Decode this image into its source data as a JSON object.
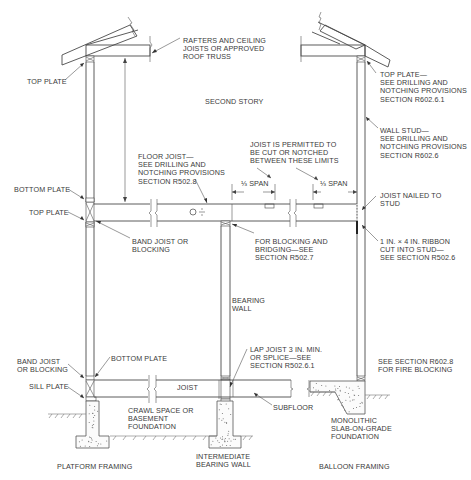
{
  "diagram": {
    "title_left": "PLATFORM FRAMING",
    "title_right": "BALLOON FRAMING",
    "title_center": "INTERMEDIATE\nBEARING WALL",
    "labels": {
      "rafters": "RAFTERS AND CEILING\nJOISTS OR APPROVED\nROOF TRUSS",
      "top_plate_left": "TOP PLATE",
      "second_story": "SECOND STORY",
      "top_plate_right": "TOP PLATE—\nSEE DRILLING AND\nNOTCHING PROVISIONS\nSECTION R602.6.1",
      "wall_stud": "WALL STUD—\nSEE DRILLING AND\nNOTCHING PROVISIONS\nSECTION R602.6",
      "floor_joist": "FLOOR JOIST—\nSEE DRILLING AND\nNOTCHING PROVISIONS\nSECTION R502.8",
      "joist_permitted": "JOIST IS PERMITTED TO\nBE CUT OR NOTCHED\nBETWEEN THESE LIMITS",
      "bottom_plate_upper": "BOTTOM PLATE",
      "top_plate_mid": "TOP PLATE",
      "span_left": "⅓ SPAN",
      "span_right": "⅓ SPAN",
      "joist_nailed": "JOIST NAILED TO\nSTUD",
      "band_joist_upper": "BAND JOIST OR\nBLOCKING",
      "blocking_bridging": "FOR BLOCKING AND\nBRIDGING—SEE\nSECTION R502.7",
      "ribbon": "1 IN. × 4 IN. RIBBON\nCUT INTO STUD—\nSEE SECTION R502.6",
      "bearing_wall": "BEARING\nWALL",
      "lap_joist": "LAP JOIST 3 IN. MIN.\nOR SPLICE—SEE\nSECTION R502.6.1",
      "see_fire_blocking": "SEE SECTION R602.8\nFOR FIRE BLOCKING",
      "band_joist_lower": "BAND JOIST\nOR BLOCKING",
      "bottom_plate_lower": "BOTTOM PLATE",
      "sill_plate": "SILL PLATE",
      "joist": "JOIST",
      "crawl_space": "CRAWL SPACE OR\nBASEMENT\nFOUNDATION",
      "subfloor": "SUBFLOOR",
      "monolithic": "MONOLITHIC\nSLAB-ON-GRADE\nFOUNDATION"
    },
    "colors": {
      "line": "#4a4a4a",
      "text": "#3a3a3a",
      "background": "#ffffff"
    }
  }
}
